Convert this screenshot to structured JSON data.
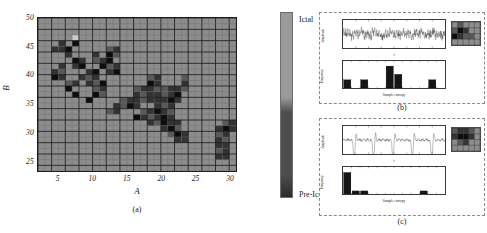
{
  "figure": {
    "panel_a": {
      "caption": "(a)",
      "xlabel": "A",
      "ylabel": "B",
      "xticks": [
        "5",
        "10",
        "15",
        "20",
        "25",
        "30"
      ],
      "yticks": [
        "25",
        "30",
        "35",
        "40",
        "45",
        "50"
      ]
    },
    "colorbar": {
      "top_label": "Ictal",
      "bottom_label": "Pre-Ictal",
      "top_color": "#9a9a9a",
      "bottom_color": "#4d4d4d"
    },
    "panel_b": {
      "caption": "(b)",
      "timeseries": {
        "ylabel": "Amplitude",
        "xlabel": "t"
      },
      "histogram": {
        "ylabel": "Frequency",
        "xlabel": "Sample entropy"
      }
    },
    "panel_c": {
      "caption": "(c)",
      "timeseries": {
        "ylabel": "Amplitude",
        "xlabel": "t"
      },
      "histogram": {
        "ylabel": "Frequency",
        "xlabel": "Sample entropy"
      }
    }
  },
  "chart_data": [
    {
      "type": "heatmap",
      "name": "panel-a-heatmap",
      "title": "",
      "xlabel": "A",
      "ylabel": "B",
      "xlim": [
        2,
        31
      ],
      "ylim": [
        23,
        50
      ],
      "xticks": [
        5,
        10,
        15,
        20,
        25,
        30
      ],
      "yticks": [
        25,
        30,
        35,
        40,
        45,
        50
      ],
      "grid": true,
      "cell_size": [
        1,
        1
      ],
      "colormap": "gray",
      "colorbar": {
        "low_label": "Pre-Ictal",
        "high_label": "Ictal"
      },
      "background_value": 0.55,
      "cells": [
        {
          "A": 6,
          "B": 47,
          "v": 0.55
        },
        {
          "A": 7,
          "B": 47,
          "v": 0.55
        },
        {
          "A": 6,
          "B": 46,
          "v": 0.55
        },
        {
          "A": 7,
          "B": 46,
          "v": 0.8
        },
        {
          "A": 5,
          "B": 45,
          "v": 0.2
        },
        {
          "A": 6,
          "B": 45,
          "v": 0.55
        },
        {
          "A": 7,
          "B": 45,
          "v": 0.05
        },
        {
          "A": 8,
          "B": 46,
          "v": 0.55
        },
        {
          "A": 8,
          "B": 45,
          "v": 0.55
        },
        {
          "A": 4,
          "B": 44,
          "v": 0.2
        },
        {
          "A": 5,
          "B": 44,
          "v": 0.2
        },
        {
          "A": 6,
          "B": 44,
          "v": 0.05
        },
        {
          "A": 7,
          "B": 44,
          "v": 0.55
        },
        {
          "A": 12,
          "B": 44,
          "v": 0.35
        },
        {
          "A": 13,
          "B": 44,
          "v": 0.2
        },
        {
          "A": 6,
          "B": 43,
          "v": 0.2
        },
        {
          "A": 7,
          "B": 43,
          "v": 0.55
        },
        {
          "A": 10,
          "B": 43,
          "v": 0.2
        },
        {
          "A": 12,
          "B": 43,
          "v": 0.05
        },
        {
          "A": 13,
          "B": 43,
          "v": 0.35
        },
        {
          "A": 7,
          "B": 42,
          "v": 0.05
        },
        {
          "A": 8,
          "B": 42,
          "v": 0.2
        },
        {
          "A": 10,
          "B": 42,
          "v": 0.35
        },
        {
          "A": 11,
          "B": 42,
          "v": 0.2
        },
        {
          "A": 12,
          "B": 42,
          "v": 0.05
        },
        {
          "A": 5,
          "B": 41,
          "v": 0.2
        },
        {
          "A": 7,
          "B": 41,
          "v": 0.2
        },
        {
          "A": 8,
          "B": 41,
          "v": 0.05
        },
        {
          "A": 11,
          "B": 41,
          "v": 0.05
        },
        {
          "A": 12,
          "B": 41,
          "v": 0.35
        },
        {
          "A": 13,
          "B": 41,
          "v": 0.2
        },
        {
          "A": 4,
          "B": 40,
          "v": 0.2
        },
        {
          "A": 5,
          "B": 40,
          "v": 0.35
        },
        {
          "A": 9,
          "B": 40,
          "v": 0.2
        },
        {
          "A": 10,
          "B": 40,
          "v": 0.05
        },
        {
          "A": 12,
          "B": 40,
          "v": 0.2
        },
        {
          "A": 13,
          "B": 40,
          "v": 0.05
        },
        {
          "A": 4,
          "B": 39,
          "v": 0.05
        },
        {
          "A": 5,
          "B": 39,
          "v": 0.2
        },
        {
          "A": 8,
          "B": 39,
          "v": 0.2
        },
        {
          "A": 9,
          "B": 39,
          "v": 0.35
        },
        {
          "A": 10,
          "B": 39,
          "v": 0.2
        },
        {
          "A": 18,
          "B": 39,
          "v": 0.35
        },
        {
          "A": 19,
          "B": 39,
          "v": 0.2
        },
        {
          "A": 23,
          "B": 39,
          "v": 0.35
        },
        {
          "A": 6,
          "B": 38,
          "v": 0.35
        },
        {
          "A": 7,
          "B": 38,
          "v": 0.2
        },
        {
          "A": 9,
          "B": 38,
          "v": 0.2
        },
        {
          "A": 10,
          "B": 38,
          "v": 0.35
        },
        {
          "A": 11,
          "B": 38,
          "v": 0.05
        },
        {
          "A": 18,
          "B": 38,
          "v": 0.05
        },
        {
          "A": 19,
          "B": 38,
          "v": 0.2
        },
        {
          "A": 23,
          "B": 38,
          "v": 0.2
        },
        {
          "A": 6,
          "B": 37,
          "v": 0.05
        },
        {
          "A": 10,
          "B": 37,
          "v": 0.35
        },
        {
          "A": 11,
          "B": 37,
          "v": 0.2
        },
        {
          "A": 16,
          "B": 37,
          "v": 0.35
        },
        {
          "A": 17,
          "B": 37,
          "v": 0.2
        },
        {
          "A": 18,
          "B": 37,
          "v": 0.2
        },
        {
          "A": 19,
          "B": 37,
          "v": 0.35
        },
        {
          "A": 20,
          "B": 37,
          "v": 0.35
        },
        {
          "A": 21,
          "B": 37,
          "v": 0.2
        },
        {
          "A": 22,
          "B": 37,
          "v": 0.2
        },
        {
          "A": 23,
          "B": 37,
          "v": 0.35
        },
        {
          "A": 7,
          "B": 36,
          "v": 0.05
        },
        {
          "A": 10,
          "B": 36,
          "v": 0.05
        },
        {
          "A": 11,
          "B": 36,
          "v": 0.35
        },
        {
          "A": 16,
          "B": 36,
          "v": 0.2
        },
        {
          "A": 17,
          "B": 36,
          "v": 0.35
        },
        {
          "A": 18,
          "B": 36,
          "v": 0.2
        },
        {
          "A": 19,
          "B": 36,
          "v": 0.2
        },
        {
          "A": 20,
          "B": 36,
          "v": 0.35
        },
        {
          "A": 21,
          "B": 36,
          "v": 0.2
        },
        {
          "A": 22,
          "B": 36,
          "v": 0.05
        },
        {
          "A": 9,
          "B": 35,
          "v": 0.05
        },
        {
          "A": 14,
          "B": 35,
          "v": 0.35
        },
        {
          "A": 15,
          "B": 35,
          "v": 0.2
        },
        {
          "A": 16,
          "B": 35,
          "v": 0.2
        },
        {
          "A": 17,
          "B": 35,
          "v": 0.35
        },
        {
          "A": 18,
          "B": 35,
          "v": 0.2
        },
        {
          "A": 19,
          "B": 35,
          "v": 0.2
        },
        {
          "A": 20,
          "B": 35,
          "v": 0.2
        },
        {
          "A": 21,
          "B": 35,
          "v": 0.05
        },
        {
          "A": 22,
          "B": 35,
          "v": 0.2
        },
        {
          "A": 13,
          "B": 34,
          "v": 0.2
        },
        {
          "A": 14,
          "B": 34,
          "v": 0.35
        },
        {
          "A": 15,
          "B": 34,
          "v": 0.05
        },
        {
          "A": 16,
          "B": 34,
          "v": 0.2
        },
        {
          "A": 19,
          "B": 34,
          "v": 0.2
        },
        {
          "A": 20,
          "B": 34,
          "v": 0.35
        },
        {
          "A": 21,
          "B": 34,
          "v": 0.2
        },
        {
          "A": 12,
          "B": 33,
          "v": 0.35
        },
        {
          "A": 13,
          "B": 33,
          "v": 0.2
        },
        {
          "A": 17,
          "B": 33,
          "v": 0.35
        },
        {
          "A": 18,
          "B": 33,
          "v": 0.2
        },
        {
          "A": 19,
          "B": 33,
          "v": 0.05
        },
        {
          "A": 20,
          "B": 33,
          "v": 0.2
        },
        {
          "A": 21,
          "B": 33,
          "v": 0.35
        },
        {
          "A": 16,
          "B": 32,
          "v": 0.05
        },
        {
          "A": 17,
          "B": 32,
          "v": 0.2
        },
        {
          "A": 18,
          "B": 32,
          "v": 0.35
        },
        {
          "A": 19,
          "B": 32,
          "v": 0.2
        },
        {
          "A": 20,
          "B": 32,
          "v": 0.05
        },
        {
          "A": 21,
          "B": 32,
          "v": 0.2
        },
        {
          "A": 18,
          "B": 31,
          "v": 0.2
        },
        {
          "A": 19,
          "B": 31,
          "v": 0.35
        },
        {
          "A": 20,
          "B": 31,
          "v": 0.05
        },
        {
          "A": 21,
          "B": 31,
          "v": 0.2
        },
        {
          "A": 22,
          "B": 31,
          "v": 0.2
        },
        {
          "A": 29,
          "B": 31,
          "v": 0.35
        },
        {
          "A": 30,
          "B": 31,
          "v": 0.2
        },
        {
          "A": 20,
          "B": 30,
          "v": 0.2
        },
        {
          "A": 21,
          "B": 30,
          "v": 0.05
        },
        {
          "A": 22,
          "B": 30,
          "v": 0.35
        },
        {
          "A": 28,
          "B": 30,
          "v": 0.2
        },
        {
          "A": 29,
          "B": 30,
          "v": 0.05
        },
        {
          "A": 30,
          "B": 30,
          "v": 0.2
        },
        {
          "A": 21,
          "B": 29,
          "v": 0.35
        },
        {
          "A": 22,
          "B": 29,
          "v": 0.05
        },
        {
          "A": 23,
          "B": 29,
          "v": 0.2
        },
        {
          "A": 28,
          "B": 29,
          "v": 0.35
        },
        {
          "A": 29,
          "B": 29,
          "v": 0.2
        },
        {
          "A": 22,
          "B": 28,
          "v": 0.2
        },
        {
          "A": 23,
          "B": 28,
          "v": 0.2
        },
        {
          "A": 28,
          "B": 28,
          "v": 0.2
        },
        {
          "A": 29,
          "B": 28,
          "v": 0.35
        },
        {
          "A": 28,
          "B": 27,
          "v": 0.2
        },
        {
          "A": 29,
          "B": 27,
          "v": 0.2
        },
        {
          "A": 28,
          "B": 26,
          "v": 0.35
        },
        {
          "A": 29,
          "B": 26,
          "v": 0.2
        },
        {
          "A": 28,
          "B": 25,
          "v": 0.2
        },
        {
          "A": 29,
          "B": 25,
          "v": 0.2
        }
      ]
    },
    {
      "type": "line",
      "name": "panel-b-timeseries",
      "title": "",
      "xlabel": "t",
      "ylabel": "Amplitude",
      "description": "Ictal EEG segment: dense high-frequency oscillation, near-uniform amplitude envelope",
      "xlim": [
        0,
        4000
      ],
      "ylim": [
        -60,
        60
      ],
      "grid": false
    },
    {
      "type": "bar",
      "name": "panel-b-histogram",
      "title": "",
      "xlabel": "Sample entropy",
      "ylabel": "Frequency",
      "description": "Ictal sample-entropy distribution: spread across mid-to-high entropy bins",
      "categories": [
        "0.1",
        "0.2",
        "0.3",
        "0.4",
        "0.5",
        "0.6",
        "0.7",
        "0.8",
        "0.9",
        "1.0",
        "1.1",
        "1.2"
      ],
      "values": [
        3.0,
        0,
        3.0,
        0,
        0,
        8.0,
        5.0,
        0,
        0,
        0,
        3.0,
        0
      ],
      "xlim": [
        0.05,
        1.25
      ],
      "ylim": [
        0,
        9
      ],
      "grid": false
    },
    {
      "type": "heatmap",
      "name": "panel-b-inset",
      "description": "Zoomed detail of heatmap region highlighted for the ictal case",
      "rows": 4,
      "cols": 5,
      "values": [
        [
          0.55,
          0.35,
          0.55,
          0.55,
          0.55
        ],
        [
          0.35,
          0.05,
          0.2,
          0.55,
          0.55
        ],
        [
          0.05,
          0.2,
          0.35,
          0.35,
          0.55
        ],
        [
          0.55,
          0.55,
          0.55,
          0.55,
          0.55
        ]
      ]
    },
    {
      "type": "line",
      "name": "panel-c-timeseries",
      "title": "",
      "xlabel": "t",
      "ylabel": "Amplitude",
      "description": "Pre-ictal EEG segment: quasi-periodic large negative spikes over a low-amplitude baseline",
      "xlim": [
        0,
        4000
      ],
      "ylim": [
        -400,
        200
      ],
      "grid": false
    },
    {
      "type": "bar",
      "name": "panel-c-histogram",
      "title": "",
      "xlabel": "Sample entropy",
      "ylabel": "Frequency",
      "description": "Pre-ictal sample-entropy distribution: strongly concentrated in the lowest entropy bins",
      "categories": [
        "0.1",
        "0.2",
        "0.3",
        "0.4",
        "0.5",
        "0.6",
        "0.7",
        "0.8",
        "0.9",
        "1.0",
        "1.1",
        "1.2"
      ],
      "values": [
        14.0,
        2.0,
        2.0,
        0,
        0,
        0,
        0,
        0,
        0,
        2.0,
        0,
        0
      ],
      "xlim": [
        0.05,
        1.25
      ],
      "ylim": [
        0,
        16
      ],
      "grid": false
    },
    {
      "type": "heatmap",
      "name": "panel-c-inset",
      "description": "Zoomed detail of heatmap region highlighted for the pre-ictal case",
      "rows": 4,
      "cols": 5,
      "values": [
        [
          0.35,
          0.2,
          0.2,
          0.35,
          0.55
        ],
        [
          0.2,
          0.05,
          0.05,
          0.2,
          0.55
        ],
        [
          0.55,
          0.35,
          0.2,
          0.55,
          0.55
        ],
        [
          0.55,
          0.55,
          0.55,
          0.55,
          0.55
        ]
      ]
    }
  ]
}
